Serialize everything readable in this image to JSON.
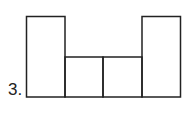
{
  "problem": {
    "number_label": "3."
  },
  "figure": {
    "stroke_color": "#222222",
    "shapes": [
      {
        "name": "left-tall-rect",
        "x": 26,
        "y": 16,
        "w": 39,
        "h": 81
      },
      {
        "name": "middle-left-square",
        "x": 65,
        "y": 57,
        "w": 38,
        "h": 40
      },
      {
        "name": "middle-right-square",
        "x": 103,
        "y": 57,
        "w": 39,
        "h": 40
      },
      {
        "name": "right-tall-rect",
        "x": 142,
        "y": 16,
        "w": 39,
        "h": 81
      }
    ]
  }
}
